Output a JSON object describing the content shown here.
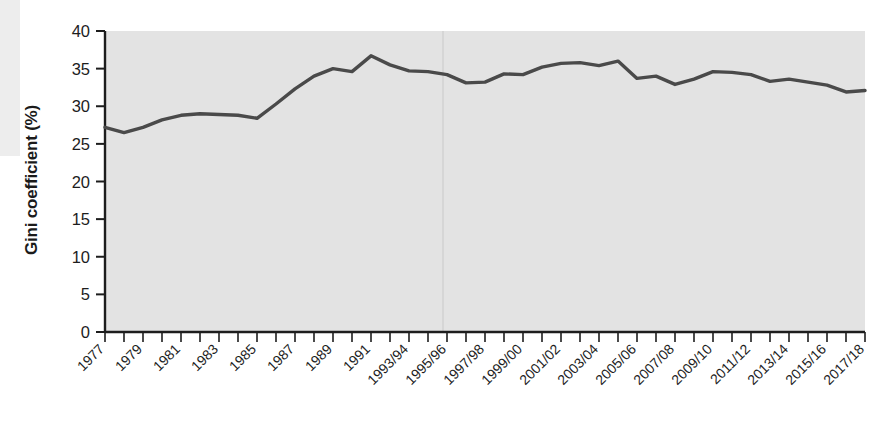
{
  "chart": {
    "type": "line",
    "ylabel": "Gini coefficient (%)",
    "xlabel": ""
  },
  "chart_data": {
    "type": "line",
    "title": "",
    "subtitle": "",
    "xlabel": "",
    "ylabel": "Gini coefficient (%)",
    "ylim": [
      0,
      40
    ],
    "yticks": [
      0,
      5,
      10,
      15,
      20,
      25,
      30,
      35,
      40
    ],
    "ytick_labels": [
      "0",
      "5",
      "10",
      "15",
      "20",
      "25",
      "30",
      "35",
      "40"
    ],
    "grid": false,
    "legend": "none",
    "x_tick_labels_shown": [
      "1977",
      "1979",
      "1981",
      "1983",
      "1985",
      "1987",
      "1989",
      "1991",
      "1993/94",
      "1995/96",
      "1997/98",
      "1999/00",
      "2001/02",
      "2003/04",
      "2005/06",
      "2007/08",
      "2009/10",
      "2011/12",
      "2013/14",
      "2015/16",
      "2017/18"
    ],
    "categories": [
      "1977",
      "1978",
      "1979",
      "1980",
      "1981",
      "1982",
      "1983",
      "1984",
      "1985",
      "1986",
      "1987",
      "1988",
      "1989",
      "1990",
      "1991",
      "1992",
      "1993/94",
      "1994/95",
      "1995/96",
      "1996/97",
      "1997/98",
      "1998/99",
      "1999/00",
      "2000/01",
      "2001/02",
      "2002/03",
      "2003/04",
      "2004/05",
      "2005/06",
      "2006/07",
      "2007/08",
      "2008/09",
      "2009/10",
      "2010/11",
      "2011/12",
      "2012/13",
      "2013/14",
      "2014/15",
      "2015/16",
      "2016/17",
      "2017/18"
    ],
    "series": [
      {
        "name": "Gini coefficient (%)",
        "color": "#4a4a4a",
        "values": [
          27.2,
          26.5,
          27.2,
          28.2,
          28.8,
          29.0,
          28.9,
          28.8,
          28.4,
          30.3,
          32.3,
          34.0,
          35.0,
          34.6,
          36.7,
          35.5,
          34.7,
          34.6,
          34.2,
          33.1,
          33.2,
          34.3,
          34.2,
          35.2,
          35.7,
          35.8,
          35.4,
          36.0,
          33.7,
          34.0,
          32.9,
          33.6,
          34.6,
          34.5,
          34.2,
          33.3,
          33.6,
          33.2,
          32.8,
          31.9,
          32.1
        ]
      }
    ]
  }
}
